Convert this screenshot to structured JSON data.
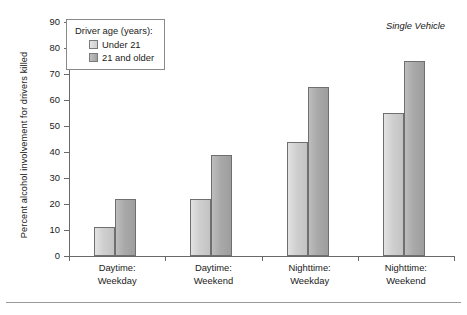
{
  "chart_data": {
    "type": "bar",
    "title": "",
    "annotation": "Single Vehicle",
    "xlabel": "",
    "ylabel": "Percent alcohol involvement for drivers killed",
    "ylim": [
      0,
      90
    ],
    "ytick_step": 10,
    "yticks": [
      "90",
      "80",
      "70",
      "60",
      "50",
      "40",
      "30",
      "20",
      "10",
      "0"
    ],
    "grid": false,
    "legend_position": "top-left-inside",
    "legend_title": "Driver age (years):",
    "categories": [
      "Daytime:\nWeekday",
      "Daytime:\nWeekend",
      "Nighttime:\nWeekday",
      "Nighttime:\nWeekend"
    ],
    "category_lines": [
      [
        "Daytime:",
        "Weekday"
      ],
      [
        "Daytime:",
        "Weekend"
      ],
      [
        "Nighttime:",
        "Weekday"
      ],
      [
        "Nighttime:",
        "Weekend"
      ]
    ],
    "series": [
      {
        "name": "Under 21",
        "color": "#cfcfcf",
        "values": [
          11,
          22,
          44,
          55
        ]
      },
      {
        "name": "21 and older",
        "color": "#a9a9a9",
        "values": [
          22,
          39,
          65,
          75
        ]
      }
    ]
  },
  "legend": {
    "title": "Driver age (years):",
    "items": [
      {
        "label": "Under 21",
        "swatch": "light"
      },
      {
        "label": "21 and older",
        "swatch": "dark"
      }
    ]
  },
  "axis": {
    "y_title": "Percent alcohol involvement for drivers killed",
    "y_ticks": [
      "90",
      "80",
      "70",
      "60",
      "50",
      "40",
      "30",
      "20",
      "10",
      "0"
    ]
  },
  "annotation": {
    "text": "Single Vehicle"
  },
  "colors": {
    "series_light": "#cfcfcf",
    "series_dark": "#a9a9a9",
    "axis": "#6a6a6a",
    "text": "#1a1a1a",
    "rule": "#9a9a9a"
  }
}
